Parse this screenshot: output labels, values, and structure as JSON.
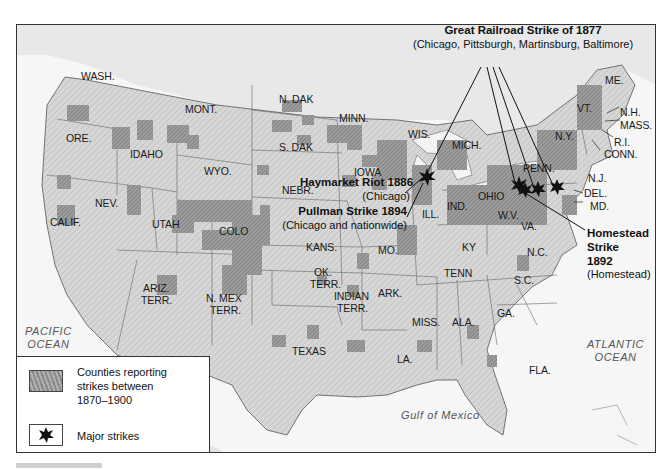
{
  "map": {
    "title_callouts": {
      "railroad": {
        "title": "Great Railroad Strike of 1877",
        "detail": "(Chicago, Pittsburgh, Martinsburg, Baltimore)"
      },
      "haymarket": {
        "title": "Haymarket Riot 1886",
        "detail": "(Chicago)"
      },
      "pullman": {
        "title": "Pullman Strike 1894",
        "detail": "(Chicago and nationwide)"
      },
      "homestead": {
        "title_line1": "Homestead",
        "title_line2": "Strike",
        "title_line3": "1892",
        "detail": "(Homestead)"
      }
    },
    "states": [
      {
        "id": "wash",
        "label": "WASH."
      },
      {
        "id": "ore",
        "label": "ORE."
      },
      {
        "id": "calif",
        "label": "CALIF."
      },
      {
        "id": "idaho",
        "label": "IDAHO"
      },
      {
        "id": "nev",
        "label": "NEV."
      },
      {
        "id": "mont",
        "label": "MONT."
      },
      {
        "id": "wyo",
        "label": "WYO."
      },
      {
        "id": "utah",
        "label": "UTAH"
      },
      {
        "id": "colo",
        "label": "COLO"
      },
      {
        "id": "ariz",
        "label": "ARIZ."
      },
      {
        "id": "ariz2",
        "label": "TERR."
      },
      {
        "id": "nmex",
        "label": "N. MEX"
      },
      {
        "id": "nmex2",
        "label": "TERR."
      },
      {
        "id": "ndak",
        "label": "N. DAK"
      },
      {
        "id": "sdak",
        "label": "S. DAK"
      },
      {
        "id": "nebr",
        "label": "NEBR."
      },
      {
        "id": "kans",
        "label": "KANS."
      },
      {
        "id": "ok",
        "label": "OK."
      },
      {
        "id": "ok2",
        "label": "TERR."
      },
      {
        "id": "indian",
        "label": "INDIAN"
      },
      {
        "id": "indian2",
        "label": "TERR."
      },
      {
        "id": "texas",
        "label": "TEXAS"
      },
      {
        "id": "minn",
        "label": "MINN."
      },
      {
        "id": "iowa",
        "label": "IOWA"
      },
      {
        "id": "mo",
        "label": "MO."
      },
      {
        "id": "ark",
        "label": "ARK."
      },
      {
        "id": "la",
        "label": "LA."
      },
      {
        "id": "wis",
        "label": "WIS."
      },
      {
        "id": "ill",
        "label": "ILL."
      },
      {
        "id": "mich",
        "label": "MICH."
      },
      {
        "id": "ind",
        "label": "IND."
      },
      {
        "id": "ohio",
        "label": "OHIO"
      },
      {
        "id": "ky",
        "label": "KY"
      },
      {
        "id": "tenn",
        "label": "TENN"
      },
      {
        "id": "miss",
        "label": "MISS."
      },
      {
        "id": "ala",
        "label": "ALA."
      },
      {
        "id": "ga",
        "label": "GA."
      },
      {
        "id": "fla",
        "label": "FLA."
      },
      {
        "id": "sc",
        "label": "S.C."
      },
      {
        "id": "nc",
        "label": "N.C."
      },
      {
        "id": "va",
        "label": "VA."
      },
      {
        "id": "wv",
        "label": "W.V."
      },
      {
        "id": "penn",
        "label": "PENN."
      },
      {
        "id": "ny",
        "label": "N.Y."
      },
      {
        "id": "vt",
        "label": "VT."
      },
      {
        "id": "me",
        "label": "ME."
      },
      {
        "id": "nh",
        "label": "N.H."
      },
      {
        "id": "mass",
        "label": "MASS."
      },
      {
        "id": "ri",
        "label": "R.I."
      },
      {
        "id": "conn",
        "label": "CONN."
      },
      {
        "id": "nj",
        "label": "N.J."
      },
      {
        "id": "del",
        "label": "DEL."
      },
      {
        "id": "md",
        "label": "MD."
      }
    ],
    "water": {
      "pacific_1": "PACIFIC",
      "pacific_2": "OCEAN",
      "atlantic_1": "ATLANTIC",
      "atlantic_2": "OCEAN",
      "gulf": "Gulf of Mexico"
    },
    "legend": {
      "counties_label": "Counties reporting strikes between 1870–1900",
      "counties_l1": "Counties reporting",
      "counties_l2": "strikes between",
      "counties_l3": "1870–1900",
      "major_label": "Major strikes",
      "counties_icon": "hatched-gray-swatch",
      "major_icon": "starburst-icon"
    },
    "colors": {
      "land": "#d9d9d9",
      "strike_counties": "#8f8f8f",
      "border": "#333333",
      "water": "#f6f6f6",
      "star": "#111111"
    }
  }
}
